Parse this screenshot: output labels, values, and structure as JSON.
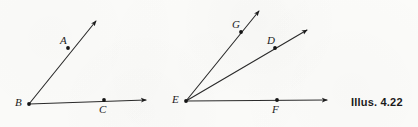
{
  "figure": {
    "caption": "Illus. 4.22",
    "width": 418,
    "height": 127,
    "background_color": "#fbfbf9",
    "ink_color": "#1b1b1b"
  },
  "chart_data": {
    "type": "diagram",
    "title": "Illus. 4.22",
    "subtitle": "",
    "xlabel": "",
    "ylabel": "",
    "xlim": [
      0,
      418
    ],
    "ylim": [
      0,
      127
    ],
    "grid": false,
    "legend": false,
    "diagrams": [
      {
        "name": "angle-abc",
        "vertex": "B",
        "vertex_point": [
          29,
          104
        ],
        "rays": [
          {
            "name": "ray-ba",
            "from": "B",
            "through": "A",
            "from_point": [
              29,
              104
            ],
            "through_point": [
              68,
              48
            ],
            "tip_point": [
              96,
              21
            ],
            "arrowhead": true
          },
          {
            "name": "ray-bc",
            "from": "B",
            "through": "C",
            "from_point": [
              29,
              104
            ],
            "through_point": [
              104,
              100
            ],
            "tip_point": [
              146,
              100
            ],
            "arrowhead": true
          }
        ],
        "points": [
          {
            "label": "A",
            "x": 68,
            "y": 48,
            "label_x": 60,
            "label_y": 35,
            "dot": true
          },
          {
            "label": "B",
            "x": 29,
            "y": 104,
            "label_x": 15,
            "label_y": 97,
            "dot": true
          },
          {
            "label": "C",
            "x": 104,
            "y": 100,
            "label_x": 99,
            "label_y": 104,
            "dot": true
          }
        ]
      },
      {
        "name": "angle-figure-e",
        "vertex": "E",
        "vertex_point": [
          186,
          101
        ],
        "rays": [
          {
            "name": "ray-eg",
            "from": "E",
            "through": "G",
            "from_point": [
              186,
              101
            ],
            "through_point": [
              241,
              32
            ],
            "tip_point": [
              259,
              11
            ],
            "arrowhead": true
          },
          {
            "name": "ray-ed",
            "from": "E",
            "through": "D",
            "from_point": [
              186,
              101
            ],
            "through_point": [
              275,
              48
            ],
            "tip_point": [
              307,
              30
            ],
            "arrowhead": true
          },
          {
            "name": "ray-ef",
            "from": "E",
            "through": "F",
            "from_point": [
              186,
              101
            ],
            "through_point": [
              277,
              100
            ],
            "tip_point": [
              327,
              100
            ],
            "arrowhead": true
          }
        ],
        "points": [
          {
            "label": "G",
            "x": 241,
            "y": 32,
            "label_x": 232,
            "label_y": 19,
            "dot": true
          },
          {
            "label": "D",
            "x": 275,
            "y": 48,
            "label_x": 267,
            "label_y": 35,
            "dot": true
          },
          {
            "label": "E",
            "x": 186,
            "y": 101,
            "label_x": 172,
            "label_y": 94,
            "dot": true
          },
          {
            "label": "F",
            "x": 277,
            "y": 100,
            "label_x": 272,
            "label_y": 104,
            "dot": true
          }
        ]
      }
    ]
  }
}
